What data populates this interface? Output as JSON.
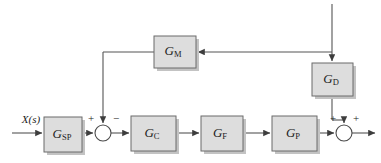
{
  "diagram": {
    "type": "control-system-block-diagram",
    "background_color": "#ffffff",
    "block_fill_color": "#dddddd",
    "block_border_color": "#6b6b6b",
    "wire_color": "#555555",
    "signals": {
      "input_label": "X(s)"
    },
    "blocks": [
      {
        "id": "gsp",
        "label": "G",
        "subscript": "SP",
        "x": 44,
        "y": 117,
        "w": 38,
        "h": 35
      },
      {
        "id": "gc",
        "label": "G",
        "subscript": "C",
        "x": 131,
        "y": 116,
        "w": 45,
        "h": 35
      },
      {
        "id": "gf",
        "label": "G",
        "subscript": "F",
        "x": 201,
        "y": 116,
        "w": 42,
        "h": 35
      },
      {
        "id": "gp",
        "label": "G",
        "subscript": "P",
        "x": 272,
        "y": 116,
        "w": 45,
        "h": 35
      },
      {
        "id": "gm",
        "label": "G",
        "subscript": "M",
        "x": 154,
        "y": 36,
        "w": 42,
        "h": 32
      },
      {
        "id": "gd",
        "label": "G",
        "subscript": "D",
        "x": 312,
        "y": 63,
        "w": 41,
        "h": 33
      }
    ],
    "summing_junctions": [
      {
        "id": "sum-left",
        "cx": 103,
        "cy": 133,
        "r": 8,
        "signs": [
          {
            "position": "left",
            "value": "+"
          },
          {
            "position": "top",
            "value": "−"
          }
        ]
      },
      {
        "id": "sum-right",
        "cx": 344,
        "cy": 133,
        "r": 8,
        "signs": [
          {
            "position": "left",
            "value": "+"
          },
          {
            "position": "top",
            "value": "+"
          }
        ]
      }
    ]
  }
}
